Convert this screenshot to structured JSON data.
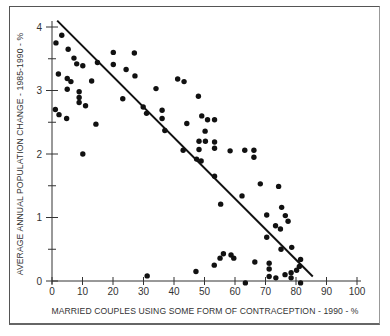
{
  "chart_data": {
    "type": "scatter",
    "title": "",
    "xlabel": "MARRIED COUPLES USING SOME FORM OF CONTRACEPTION - 1990 - %",
    "ylabel": "AVERAGE ANNUAL POPULATION CHANGE - 1985-1990 - %",
    "xlim": [
      0,
      100
    ],
    "ylim": [
      0,
      4
    ],
    "x_ticks": [
      0,
      10,
      20,
      30,
      40,
      50,
      60,
      70,
      80,
      90,
      100
    ],
    "y_ticks": [
      0,
      1,
      2,
      3,
      4
    ],
    "y_minor_ticks": [
      0.5,
      1.5,
      2.5,
      3.5
    ],
    "grid": false,
    "legend": null,
    "series": [
      {
        "name": "Countries",
        "points": [
          [
            3.2,
            3.87
          ],
          [
            1.3,
            3.75
          ],
          [
            5.3,
            3.65
          ],
          [
            7.2,
            3.51
          ],
          [
            8.1,
            3.42
          ],
          [
            10.1,
            3.39
          ],
          [
            2.1,
            3.26
          ],
          [
            5.0,
            3.19
          ],
          [
            6.2,
            3.14
          ],
          [
            13.0,
            3.15
          ],
          [
            14.9,
            3.44
          ],
          [
            20.1,
            3.6
          ],
          [
            20.1,
            3.41
          ],
          [
            27.0,
            3.59
          ],
          [
            24.3,
            3.33
          ],
          [
            27.2,
            3.23
          ],
          [
            5.0,
            3.02
          ],
          [
            8.9,
            2.98
          ],
          [
            8.9,
            2.89
          ],
          [
            8.9,
            2.81
          ],
          [
            11.0,
            2.76
          ],
          [
            1.1,
            2.7
          ],
          [
            2.3,
            2.62
          ],
          [
            4.8,
            2.56
          ],
          [
            23.2,
            2.87
          ],
          [
            29.9,
            2.74
          ],
          [
            31.0,
            2.64
          ],
          [
            14.4,
            2.47
          ],
          [
            10.1,
            2.0
          ],
          [
            34.1,
            3.03
          ],
          [
            41.2,
            3.18
          ],
          [
            43.3,
            3.14
          ],
          [
            36.1,
            2.69
          ],
          [
            36.1,
            2.56
          ],
          [
            37.0,
            2.37
          ],
          [
            48.0,
            2.91
          ],
          [
            44.2,
            2.48
          ],
          [
            49.1,
            2.6
          ],
          [
            51.0,
            2.54
          ],
          [
            53.3,
            2.54
          ],
          [
            50.2,
            2.36
          ],
          [
            48.2,
            2.2
          ],
          [
            50.3,
            2.2
          ],
          [
            53.3,
            2.19
          ],
          [
            53.3,
            2.09
          ],
          [
            48.2,
            2.07
          ],
          [
            43.0,
            2.06
          ],
          [
            58.4,
            2.05
          ],
          [
            63.2,
            2.06
          ],
          [
            66.2,
            2.06
          ],
          [
            66.2,
            1.95
          ],
          [
            47.4,
            1.92
          ],
          [
            48.9,
            1.89
          ],
          [
            53.3,
            1.65
          ],
          [
            68.3,
            1.53
          ],
          [
            74.3,
            1.49
          ],
          [
            62.3,
            1.34
          ],
          [
            55.3,
            1.21
          ],
          [
            75.3,
            1.16
          ],
          [
            70.4,
            1.04
          ],
          [
            76.5,
            1.03
          ],
          [
            77.4,
            0.94
          ],
          [
            73.3,
            0.87
          ],
          [
            74.9,
            0.82
          ],
          [
            70.4,
            0.69
          ],
          [
            78.6,
            0.53
          ],
          [
            75.1,
            0.5
          ],
          [
            66.5,
            0.3
          ],
          [
            56.2,
            0.43
          ],
          [
            58.7,
            0.41
          ],
          [
            55.1,
            0.36
          ],
          [
            59.6,
            0.36
          ],
          [
            81.5,
            0.34
          ],
          [
            71.2,
            0.28
          ],
          [
            53.2,
            0.25
          ],
          [
            81.1,
            0.23
          ],
          [
            71.2,
            0.19
          ],
          [
            80.2,
            0.17
          ],
          [
            47.2,
            0.15
          ],
          [
            78.4,
            0.13
          ],
          [
            76.4,
            0.1
          ],
          [
            71.2,
            0.07
          ],
          [
            73.4,
            0.05
          ],
          [
            78.4,
            0.05
          ],
          [
            63.4,
            -0.03
          ],
          [
            81.5,
            -0.03
          ],
          [
            31.2,
            0.08
          ]
        ]
      }
    ],
    "trend_line": {
      "x1": 1.7,
      "y1": 4.1,
      "x2": 85.5,
      "y2": 0.07
    },
    "colors": {
      "points": "#111111",
      "line": "#111111",
      "axis": "#333333",
      "frame": "#555555"
    }
  }
}
